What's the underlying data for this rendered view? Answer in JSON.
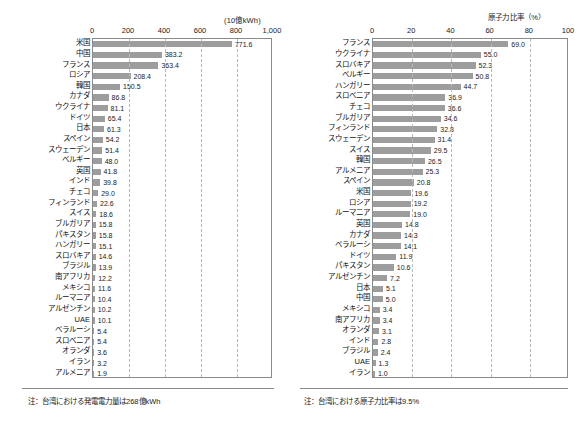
{
  "left": {
    "unit_label": "(10億kWh)",
    "axis_ticks": [
      "0",
      "200",
      "400",
      "600",
      "800",
      "1,000"
    ],
    "axis_max": 1000,
    "footnote": "注：台湾における発電電力量は268億kWh",
    "chart_data": {
      "type": "bar",
      "orientation": "horizontal",
      "title": "",
      "xlabel": "(10億kWh)",
      "ylabel": "",
      "xlim": [
        0,
        1000
      ],
      "grid": true,
      "legend": "none",
      "categories": [
        "米国",
        "中国",
        "フランス",
        "ロシア",
        "韓国",
        "カナダ",
        "ウクライナ",
        "ドイツ",
        "日本",
        "スペイン",
        "スウェーデン",
        "ベルギー",
        "英国",
        "インド",
        "チェコ",
        "フィンランド",
        "スイス",
        "ブルガリア",
        "パキスタン",
        "ハンガリー",
        "スロバキア",
        "ブラジル",
        "南アフリカ",
        "メキシコ",
        "ルーマニア",
        "アルゼンチン",
        "UAE",
        "ベラルーシ",
        "スロベニア",
        "オランダ",
        "イラン",
        "アルメニア"
      ],
      "values": [
        771.6,
        383.2,
        363.4,
        208.4,
        150.5,
        86.8,
        81.1,
        65.4,
        61.3,
        54.2,
        51.4,
        48.0,
        41.8,
        39.8,
        29.0,
        22.6,
        18.6,
        15.8,
        15.8,
        15.1,
        14.6,
        13.9,
        12.2,
        11.6,
        10.4,
        10.2,
        10.1,
        5.4,
        5.4,
        3.6,
        3.2,
        1.9
      ],
      "value_labels": [
        "771.6",
        "383.2",
        "363.4",
        "208.4",
        "150.5",
        "86.8",
        "81.1",
        "65.4",
        "61.3",
        "54.2",
        "51.4",
        "48.0",
        "41.8",
        "39.8",
        "29.0",
        "22.6",
        "18.6",
        "15.8",
        "15.8",
        "15.1",
        "14.6",
        "13.9",
        "12.2",
        "11.6",
        "10.4",
        "10.2",
        "10.1",
        "5.4",
        "5.4",
        "3.6",
        "3.2",
        "1.9"
      ]
    }
  },
  "right": {
    "unit_label": "原子力比率（%）",
    "axis_ticks": [
      "0",
      "20",
      "40",
      "60",
      "80",
      "100"
    ],
    "axis_max": 100,
    "footnote": "注：台湾における原子力比率は9.5%",
    "chart_data": {
      "type": "bar",
      "orientation": "horizontal",
      "title": "",
      "xlabel": "原子力比率（%）",
      "ylabel": "",
      "xlim": [
        0,
        100
      ],
      "grid": true,
      "legend": "none",
      "categories": [
        "フランス",
        "ウクライナ",
        "スロバキア",
        "ベルギー",
        "ハンガリー",
        "スロベニア",
        "チェコ",
        "ブルガリア",
        "フィンランド",
        "スウェーデン",
        "スイス",
        "韓国",
        "アルメニア",
        "スペイン",
        "米国",
        "ロシア",
        "ルーマニア",
        "英国",
        "カナダ",
        "ベラルーシ",
        "ドイツ",
        "パキスタン",
        "アルゼンチン",
        "日本",
        "中国",
        "メキシコ",
        "南アフリカ",
        "オランダ",
        "インド",
        "ブラジル",
        "UAE",
        "イラン"
      ],
      "values": [
        69.0,
        55.0,
        52.3,
        50.8,
        44.7,
        36.9,
        36.6,
        34.6,
        32.8,
        31.4,
        29.5,
        26.5,
        25.3,
        20.8,
        19.6,
        19.2,
        19.0,
        14.8,
        14.3,
        14.1,
        11.9,
        10.6,
        7.2,
        5.1,
        5.0,
        3.4,
        3.4,
        3.1,
        2.8,
        2.4,
        1.3,
        1.0
      ],
      "value_labels": [
        "69.0",
        "55.0",
        "52.3",
        "50.8",
        "44.7",
        "36.9",
        "36.6",
        "34.6",
        "32.8",
        "31.4",
        "29.5",
        "26.5",
        "25.3",
        "20.8",
        "19.6",
        "19.2",
        "19.0",
        "14.8",
        "14.3",
        "14.1",
        "11.9",
        "10.6",
        "7.2",
        "5.1",
        "5.0",
        "3.4",
        "3.4",
        "3.1",
        "2.8",
        "2.4",
        "1.3",
        "1.0"
      ]
    }
  },
  "style": {
    "bar_color": "#9d9d9d",
    "frame_color": "#8a8a8a",
    "grid_color": "#b9b9b9",
    "text_color": "#1a1a1a",
    "background": "#ffffff"
  }
}
